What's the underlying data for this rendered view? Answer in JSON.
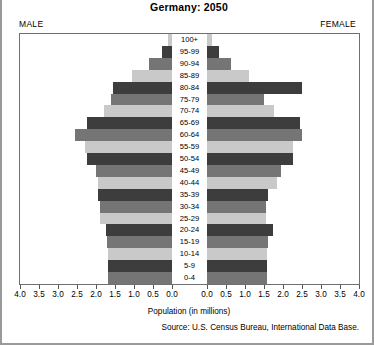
{
  "header": {
    "title": "Germany: 2050",
    "male_label": "MALE",
    "female_label": "FEMALE"
  },
  "footer": {
    "xlabel": "Population (in millions)",
    "source": "Source: U.S. Census Bureau, International Data Base."
  },
  "colors": {
    "dark": "#3d3d3d",
    "mid": "#757575",
    "light": "#c9c9c9",
    "frame": "#6f6f6f",
    "background": "#ffffff"
  },
  "chart_data": {
    "type": "bar",
    "subtype": "population-pyramid",
    "title": "Germany: 2050",
    "xlabel": "Population (in millions)",
    "ylabel": "",
    "grid": false,
    "legend": false,
    "axis_max": 4.0,
    "tick_step": 0.5,
    "left_tick_labels": [
      "4.0",
      "3.5",
      "3.0",
      "2.5",
      "2.0",
      "1.5",
      "1.0",
      "0.5",
      "0.0"
    ],
    "right_tick_labels": [
      "0.0",
      "0.5",
      "1.0",
      "1.5",
      "2.0",
      "2.5",
      "3.0",
      "3.5",
      "4.0"
    ],
    "categories": [
      "100+",
      "95-99",
      "90-94",
      "85-89",
      "80-84",
      "75-79",
      "70-74",
      "65-69",
      "60-64",
      "55-59",
      "50-54",
      "45-49",
      "40-44",
      "35-39",
      "30-34",
      "25-29",
      "20-24",
      "15-19",
      "10-14",
      "5-9",
      "0-4"
    ],
    "series": [
      {
        "name": "MALE",
        "side": "left",
        "values": [
          0.1,
          0.27,
          0.6,
          1.05,
          1.55,
          1.6,
          1.8,
          2.25,
          2.55,
          2.3,
          2.25,
          2.0,
          1.95,
          1.95,
          1.9,
          1.9,
          1.75,
          1.7,
          1.68,
          1.68,
          1.68
        ]
      },
      {
        "name": "FEMALE",
        "side": "right",
        "values": [
          0.12,
          0.32,
          0.62,
          1.1,
          2.5,
          1.5,
          1.75,
          2.45,
          2.5,
          2.25,
          2.25,
          1.95,
          1.85,
          1.6,
          1.55,
          1.55,
          1.73,
          1.6,
          1.57,
          1.57,
          1.57
        ]
      }
    ],
    "shades": [
      "light",
      "dark",
      "mid",
      "light",
      "dark",
      "mid",
      "light",
      "dark",
      "mid",
      "light",
      "dark",
      "mid",
      "light",
      "dark",
      "mid",
      "light",
      "dark",
      "mid",
      "light",
      "dark",
      "mid"
    ]
  }
}
